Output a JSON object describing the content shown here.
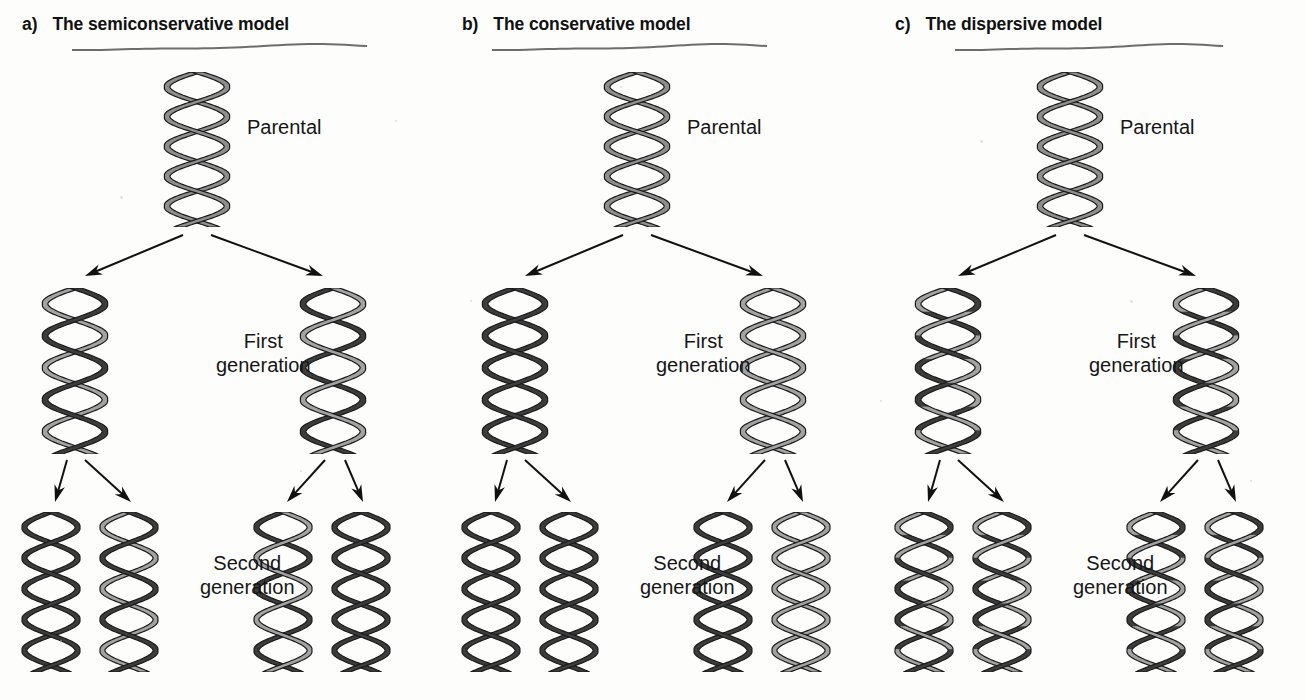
{
  "figure": {
    "background_color": "#fdfdfc",
    "strand_colors": {
      "parental_gray": "#8e8e8e",
      "old_light": "#a2a2a2",
      "new_dark": "#3c3c3c",
      "outline": "#1b1b1b",
      "underline_ink": "#6d6d6d",
      "arrow": "#111111",
      "text": "#131313"
    },
    "labels": {
      "parental": "Parental",
      "first_generation": "First\ngeneration",
      "second_generation": "Second\ngeneration"
    }
  },
  "panels": [
    {
      "id": "a",
      "letter": "a)",
      "title": "The semiconservative model",
      "underline": true,
      "parental": {
        "label": "Parental",
        "strands": [
          "parental",
          "parental"
        ]
      },
      "first_generation": {
        "label": "First\ngeneration",
        "helices": [
          {
            "strands": [
              "new",
              "old"
            ]
          },
          {
            "strands": [
              "old",
              "new"
            ]
          }
        ]
      },
      "second_generation": {
        "label": "Second\ngeneration",
        "helices": [
          {
            "strands": [
              "new",
              "new"
            ]
          },
          {
            "strands": [
              "new",
              "old"
            ]
          },
          {
            "strands": [
              "old",
              "new"
            ]
          },
          {
            "strands": [
              "new",
              "new"
            ]
          }
        ]
      }
    },
    {
      "id": "b",
      "letter": "b)",
      "title": "The conservative model",
      "underline": true,
      "parental": {
        "label": "Parental",
        "strands": [
          "parental",
          "parental"
        ]
      },
      "first_generation": {
        "label": "First\ngeneration",
        "helices": [
          {
            "strands": [
              "new",
              "new"
            ]
          },
          {
            "strands": [
              "old",
              "old"
            ]
          }
        ]
      },
      "second_generation": {
        "label": "Second\ngeneration",
        "helices": [
          {
            "strands": [
              "new",
              "new"
            ]
          },
          {
            "strands": [
              "new",
              "new"
            ]
          },
          {
            "strands": [
              "new",
              "new"
            ]
          },
          {
            "strands": [
              "old",
              "old"
            ]
          }
        ]
      }
    },
    {
      "id": "c",
      "letter": "c)",
      "title": "The dispersive model",
      "underline": true,
      "parental": {
        "label": "Parental",
        "strands": [
          "parental",
          "parental"
        ]
      },
      "first_generation": {
        "label": "First\ngeneration",
        "helices": [
          {
            "strands": [
              "mixed",
              "mixed"
            ]
          },
          {
            "strands": [
              "mixed",
              "mixed"
            ]
          }
        ]
      },
      "second_generation": {
        "label": "Second\ngeneration",
        "helices": [
          {
            "strands": [
              "mixed",
              "mixed"
            ]
          },
          {
            "strands": [
              "mixed",
              "mixed"
            ]
          },
          {
            "strands": [
              "mixed",
              "mixed"
            ]
          },
          {
            "strands": [
              "mixed",
              "mixed"
            ]
          }
        ]
      }
    }
  ],
  "geometry": {
    "panel_width": 433,
    "parental_helix": {
      "x": 160,
      "y": 72,
      "w": 74,
      "h": 155
    },
    "first_gen_helix": {
      "y": 288,
      "w": 74,
      "h": 166,
      "left_x": 38,
      "right_x": 296
    },
    "second_gen_helix": {
      "y": 512,
      "w": 66,
      "h": 160,
      "xs": [
        18,
        96,
        250,
        328
      ]
    },
    "parental_label": {
      "x": 247,
      "y": 116
    },
    "first_label": {
      "x": 216,
      "y": 330
    },
    "second_label": {
      "x": 200,
      "y": 552
    }
  }
}
